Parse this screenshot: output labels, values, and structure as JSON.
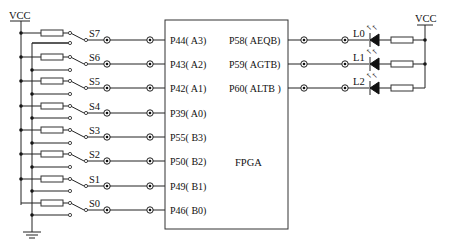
{
  "diagram": {
    "title": "FPGA",
    "power_left": "VCC",
    "power_right": "VCC",
    "switches": [
      {
        "label": "S7",
        "pin": "P44( A3)"
      },
      {
        "label": "S6",
        "pin": "P43( A2)"
      },
      {
        "label": "S5",
        "pin": "P42( A1)"
      },
      {
        "label": "S4",
        "pin": "P39( A0)"
      },
      {
        "label": "S3",
        "pin": "P55( B3)"
      },
      {
        "label": "S2",
        "pin": "P50( B2)"
      },
      {
        "label": "S1",
        "pin": "P49( B1)"
      },
      {
        "label": "S0",
        "pin": "P46( B0)"
      }
    ],
    "outputs": [
      {
        "pin": "P58( AEQB)",
        "led": "L0"
      },
      {
        "pin": "P59( AGTB)",
        "led": "L1"
      },
      {
        "pin": "P60( ALTB )",
        "led": "L2"
      }
    ],
    "ground_symbol": "ground-icon"
  }
}
